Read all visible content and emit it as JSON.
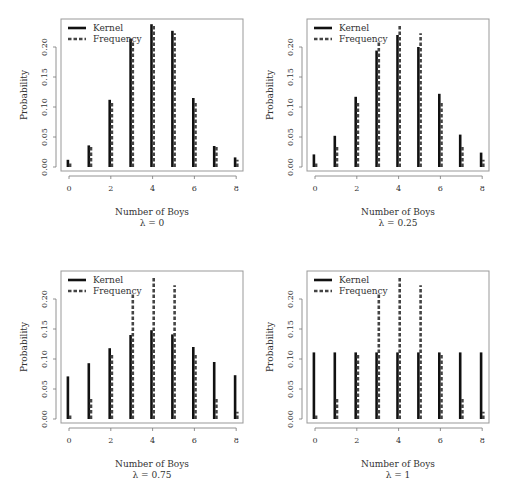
{
  "chart_data": [
    {
      "type": "bar",
      "title": "",
      "subtitle": "λ = 0",
      "xlabel": "Number of Boys",
      "ylabel": "Probability",
      "x": [
        0,
        1,
        2,
        3,
        4,
        5,
        6,
        7,
        8
      ],
      "xticks": [
        "0",
        "2",
        "4",
        "6",
        "8"
      ],
      "yticks": [
        "0.00",
        "0.05",
        "0.10",
        "0.15",
        "0.20"
      ],
      "ylim": [
        0,
        0.24
      ],
      "legend": {
        "position": "top-left",
        "entries": [
          "Kernel",
          "Frequency"
        ]
      },
      "series": [
        {
          "name": "Kernel",
          "style": "solid",
          "values": [
            0.012,
            0.036,
            0.112,
            0.214,
            0.238,
            0.227,
            0.115,
            0.035,
            0.016
          ]
        },
        {
          "name": "Frequency",
          "style": "dashed",
          "values": [
            0.009,
            0.035,
            0.108,
            0.209,
            0.238,
            0.223,
            0.108,
            0.035,
            0.012
          ]
        }
      ]
    },
    {
      "type": "bar",
      "title": "",
      "subtitle": "λ = 0.25",
      "xlabel": "Number of Boys",
      "ylabel": "Probability",
      "x": [
        0,
        1,
        2,
        3,
        4,
        5,
        6,
        7,
        8
      ],
      "xticks": [
        "0",
        "2",
        "4",
        "6",
        "8"
      ],
      "yticks": [
        "0.00",
        "0.05",
        "0.10",
        "0.15",
        "0.20"
      ],
      "ylim": [
        0,
        0.24
      ],
      "legend": {
        "position": "top-left",
        "entries": [
          "Kernel",
          "Frequency"
        ]
      },
      "series": [
        {
          "name": "Kernel",
          "style": "solid",
          "values": [
            0.021,
            0.052,
            0.117,
            0.194,
            0.22,
            0.2,
            0.122,
            0.054,
            0.024
          ]
        },
        {
          "name": "Frequency",
          "style": "dashed",
          "values": [
            0.009,
            0.035,
            0.108,
            0.209,
            0.238,
            0.223,
            0.108,
            0.035,
            0.012
          ]
        }
      ]
    },
    {
      "type": "bar",
      "title": "",
      "subtitle": "λ = 0.75",
      "xlabel": "Number of Boys",
      "ylabel": "Probability",
      "x": [
        0,
        1,
        2,
        3,
        4,
        5,
        6,
        7,
        8
      ],
      "xticks": [
        "0",
        "2",
        "4",
        "6",
        "8"
      ],
      "yticks": [
        "0.00",
        "0.05",
        "0.10",
        "0.15",
        "0.20"
      ],
      "ylim": [
        0,
        0.24
      ],
      "legend": {
        "position": "top-left",
        "entries": [
          "Kernel",
          "Frequency"
        ]
      },
      "series": [
        {
          "name": "Kernel",
          "style": "solid",
          "values": [
            0.071,
            0.093,
            0.118,
            0.14,
            0.148,
            0.141,
            0.12,
            0.095,
            0.073
          ]
        },
        {
          "name": "Frequency",
          "style": "dashed",
          "values": [
            0.009,
            0.035,
            0.108,
            0.209,
            0.238,
            0.223,
            0.108,
            0.035,
            0.012
          ]
        }
      ]
    },
    {
      "type": "bar",
      "title": "",
      "subtitle": "λ = 1",
      "xlabel": "Number of Boys",
      "ylabel": "Probability",
      "x": [
        0,
        1,
        2,
        3,
        4,
        5,
        6,
        7,
        8
      ],
      "xticks": [
        "0",
        "2",
        "4",
        "6",
        "8"
      ],
      "yticks": [
        "0.00",
        "0.05",
        "0.10",
        "0.15",
        "0.20"
      ],
      "ylim": [
        0,
        0.24
      ],
      "legend": {
        "position": "top-left",
        "entries": [
          "Kernel",
          "Frequency"
        ]
      },
      "series": [
        {
          "name": "Kernel",
          "style": "solid",
          "values": [
            0.111,
            0.111,
            0.111,
            0.111,
            0.111,
            0.111,
            0.111,
            0.111,
            0.111
          ]
        },
        {
          "name": "Frequency",
          "style": "dashed",
          "values": [
            0.009,
            0.035,
            0.108,
            0.209,
            0.238,
            0.223,
            0.108,
            0.035,
            0.012
          ]
        }
      ]
    }
  ]
}
